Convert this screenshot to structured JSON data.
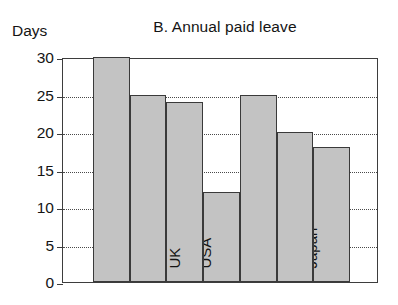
{
  "chart_data": {
    "type": "bar",
    "title": "B. Annual paid leave",
    "xlabel": "",
    "ylabel": "Days",
    "categories": [
      "Germany",
      "France",
      "UK",
      "USA",
      "Finland",
      "Poland",
      "Japan"
    ],
    "values": [
      30,
      25,
      24,
      12,
      25,
      20,
      18
    ],
    "ylim": [
      0,
      30
    ],
    "yticks": [
      0,
      5,
      10,
      15,
      20,
      25,
      30
    ],
    "ytick_labels": [
      "0",
      "5",
      "10",
      "15",
      "20",
      "25",
      "30"
    ],
    "grid": "horizontal-dotted",
    "legend": "none",
    "bar_fill_color": "#c3c3c3",
    "bar_edge_color": "#3a3a3a",
    "axis_color": "#3d3d3d",
    "background_color": "#ffffff",
    "label_orientation": "vertical-inside-bars"
  }
}
